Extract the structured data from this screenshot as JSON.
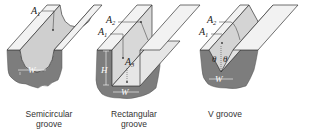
{
  "figure": {
    "panels": [
      {
        "id": "semicircular",
        "caption_line1": "Semicircular",
        "caption_line2": "groove",
        "labels": {
          "a1": "A",
          "a1_sub": "1",
          "w": "W"
        }
      },
      {
        "id": "rectangular",
        "caption_line1": "Rectangular",
        "caption_line2": "groove",
        "labels": {
          "a1": "A",
          "a1_sub": "1",
          "a2": "A",
          "a2_sub": "2",
          "a3": "A",
          "a3_sub": "3",
          "h": "H",
          "w": "W"
        }
      },
      {
        "id": "v",
        "caption_line1": "V groove",
        "labels": {
          "a1": "A",
          "a1_sub": "1",
          "a2": "A",
          "a2_sub": "2",
          "theta_left": "θ",
          "theta_right": "θ",
          "w": "W"
        }
      }
    ],
    "colors": {
      "surface_top": "#f4f4f4",
      "groove_wall": "#d0d0d0",
      "groove_floor": "#c4c4c4",
      "substrate": "#7d7d7d",
      "outline": "#333333"
    }
  }
}
